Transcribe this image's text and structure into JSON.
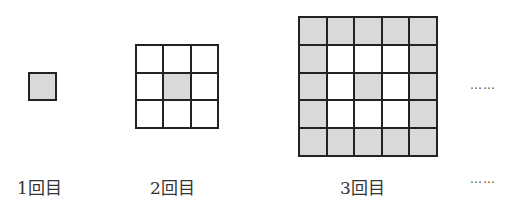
{
  "figures": [
    {
      "label": "1回目",
      "size": 1,
      "shaded": [
        [
          1
        ]
      ]
    },
    {
      "label": "2回目",
      "size": 3,
      "shaded": [
        [
          0,
          0,
          0
        ],
        [
          0,
          1,
          0
        ],
        [
          0,
          0,
          0
        ]
      ]
    },
    {
      "label": "3回目",
      "size": 5,
      "shaded": [
        [
          1,
          1,
          1,
          1,
          1
        ],
        [
          1,
          0,
          0,
          0,
          1
        ],
        [
          1,
          0,
          1,
          0,
          1
        ],
        [
          1,
          0,
          0,
          0,
          1
        ],
        [
          1,
          1,
          1,
          1,
          1
        ]
      ]
    }
  ],
  "continuation": {
    "figure_dots": "……",
    "label_dots": "……"
  },
  "colors": {
    "shaded": "#d9d9d9",
    "line": "#222222"
  }
}
